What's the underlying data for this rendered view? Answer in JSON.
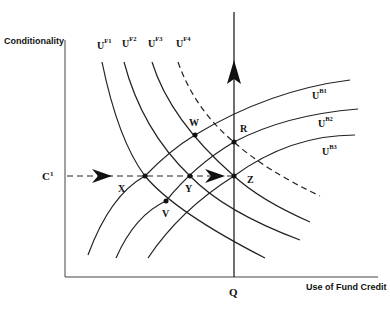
{
  "axes": {
    "y_label": "Conditionality",
    "x_label": "Use of Fund Credit",
    "x_tick": "Q",
    "y_tick": "C",
    "y_tick_sup": "1"
  },
  "fund_curves": [
    {
      "base": "U",
      "sup": "F1",
      "style": "solid"
    },
    {
      "base": "U",
      "sup": "F2",
      "style": "solid"
    },
    {
      "base": "U",
      "sup": "F3",
      "style": "solid"
    },
    {
      "base": "U",
      "sup": "F4",
      "style": "dashed"
    }
  ],
  "borrower_curves": [
    {
      "base": "U",
      "sup": "B1"
    },
    {
      "base": "U",
      "sup": "B2"
    },
    {
      "base": "U",
      "sup": "B3"
    }
  ],
  "points": {
    "X": "X",
    "Y": "Y",
    "Z": "Z",
    "V": "V",
    "W": "W",
    "R": "R"
  }
}
